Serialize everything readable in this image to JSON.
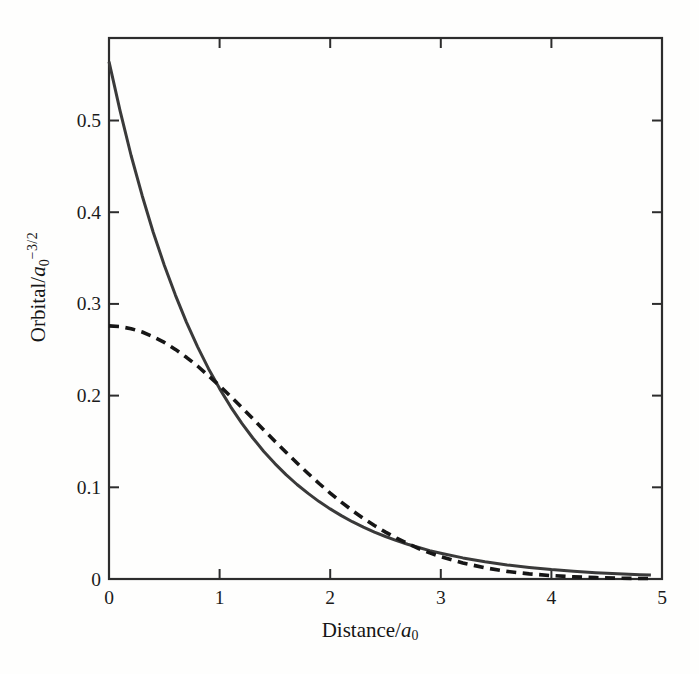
{
  "figure": {
    "background": "#fefefd",
    "frame_color": "#2d2d2d",
    "tick_color": "#2d2d2d",
    "text_color": "#1b1b1b",
    "xlabel_parts": {
      "prefix": "Distance/",
      "symbol": "a",
      "sub": "0"
    },
    "ylabel_parts": {
      "prefix": "Orbital/",
      "symbol": "a",
      "sub": "0",
      "sup": "−3/2"
    }
  },
  "chart_data": {
    "type": "line",
    "title": "",
    "xlabel": "Distance/a0",
    "ylabel": "Orbital/a0^(-3/2)",
    "xlim": [
      0,
      5
    ],
    "ylim": [
      0,
      0.59
    ],
    "xticks": [
      0,
      1,
      2,
      3,
      4,
      5
    ],
    "yticks": [
      0,
      0.1,
      0.2,
      0.3,
      0.4,
      0.5
    ],
    "grid": false,
    "legend_position": "none",
    "frame": "closed box, ticks point inward on all four sides",
    "x": [
      0,
      0.1,
      0.2,
      0.3,
      0.4,
      0.5,
      0.6,
      0.7,
      0.8,
      0.9,
      1.0,
      1.1,
      1.2,
      1.3,
      1.4,
      1.5,
      1.6,
      1.7,
      1.8,
      1.9,
      2.0,
      2.1,
      2.2,
      2.3,
      2.4,
      2.5,
      2.6,
      2.7,
      2.8,
      2.9,
      3.0,
      3.2,
      3.4,
      3.6,
      3.8,
      4.0,
      4.2,
      4.4,
      4.6,
      4.8,
      4.9
    ],
    "series": [
      {
        "name": "solid-curve",
        "description": "exponential decay, approx 0.564*exp(-r); starts at 0.56, crosses dashed near r=1 (y=0.21) and r=2.8",
        "line_style": "solid",
        "color": "#3a3a3a",
        "stroke_width": 3,
        "dash_pattern": "",
        "values": [
          0.5642,
          0.5105,
          0.4619,
          0.418,
          0.3782,
          0.3422,
          0.3096,
          0.2802,
          0.2535,
          0.2294,
          0.2076,
          0.1878,
          0.1699,
          0.1538,
          0.1391,
          0.1259,
          0.1139,
          0.1031,
          0.0933,
          0.0844,
          0.0764,
          0.0691,
          0.0625,
          0.0566,
          0.0512,
          0.0463,
          0.0419,
          0.0379,
          0.0343,
          0.031,
          0.0281,
          0.023,
          0.0188,
          0.0154,
          0.0126,
          0.0103,
          0.0085,
          0.0069,
          0.0057,
          0.0046,
          0.0042
        ]
      },
      {
        "name": "dashed-curve",
        "description": "gaussian, approx 0.276*exp(-0.27*r^2); flat at origin (0.28), above solid between r=1 and r=2.8, below after",
        "line_style": "dashed",
        "color": "#161616",
        "stroke_width": 3.6,
        "dash_pattern": "10 6.5",
        "values": [
          0.276,
          0.2753,
          0.273,
          0.2694,
          0.2643,
          0.258,
          0.2504,
          0.2418,
          0.2323,
          0.2217,
          0.2107,
          0.1991,
          0.1871,
          0.1749,
          0.1626,
          0.1503,
          0.1383,
          0.1265,
          0.1151,
          0.1041,
          0.0937,
          0.0839,
          0.0747,
          0.0661,
          0.0583,
          0.0511,
          0.0445,
          0.0386,
          0.0332,
          0.0285,
          0.0243,
          0.0174,
          0.0122,
          0.0083,
          0.0056,
          0.0037,
          0.0024,
          0.0015,
          0.0009,
          0.0005,
          0.0004
        ]
      }
    ]
  }
}
